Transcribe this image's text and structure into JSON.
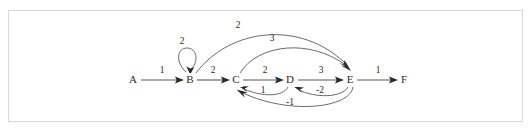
{
  "figure": {
    "type": "directed-weighted-graph",
    "border_color": "#d8d8d8",
    "background": "#ffffff",
    "line_color": "#595959",
    "text_color": "#2b2b2b"
  },
  "nodes": [
    {
      "id": "A",
      "label": "A",
      "x": 133,
      "y": 80
    },
    {
      "id": "B",
      "label": "B",
      "x": 190,
      "y": 80
    },
    {
      "id": "C",
      "label": "C",
      "x": 236,
      "y": 80
    },
    {
      "id": "D",
      "label": "D",
      "x": 290,
      "y": 80
    },
    {
      "id": "E",
      "label": "E",
      "x": 350,
      "y": 80
    },
    {
      "id": "F",
      "label": "F",
      "x": 404,
      "y": 80
    }
  ],
  "edges": [
    {
      "id": "a-b",
      "from": "A",
      "to": "B",
      "weight": "1",
      "shape": "straight",
      "label_x": 162,
      "label_y": 71
    },
    {
      "id": "b-b",
      "from": "B",
      "to": "B",
      "weight": "2",
      "shape": "self-loop",
      "label_x": 182,
      "label_y": 42
    },
    {
      "id": "b-c",
      "from": "B",
      "to": "C",
      "weight": "2",
      "shape": "straight",
      "label_x": 213,
      "label_y": 71
    },
    {
      "id": "c-d",
      "from": "C",
      "to": "D",
      "weight": "2",
      "shape": "straight",
      "label_x": 265,
      "label_y": 71
    },
    {
      "id": "d-e",
      "from": "D",
      "to": "E",
      "weight": "3",
      "shape": "straight",
      "label_x": 321,
      "label_y": 71
    },
    {
      "id": "e-f",
      "from": "E",
      "to": "F",
      "weight": "1",
      "shape": "straight",
      "label_x": 378,
      "label_y": 71
    },
    {
      "id": "b-e",
      "from": "B",
      "to": "E",
      "weight": "2",
      "shape": "arc-above",
      "label_x": 238,
      "label_y": 26
    },
    {
      "id": "c-e",
      "from": "C",
      "to": "E",
      "weight": "3",
      "shape": "arc-above",
      "label_x": 272,
      "label_y": 39
    },
    {
      "id": "d-c",
      "from": "D",
      "to": "C",
      "weight": "1",
      "shape": "arc-below",
      "label_x": 263,
      "label_y": 91
    },
    {
      "id": "e-d",
      "from": "E",
      "to": "D",
      "weight": "-2",
      "shape": "arc-below",
      "label_x": 320,
      "label_y": 91
    },
    {
      "id": "e-c",
      "from": "E",
      "to": "C",
      "weight": "-1",
      "shape": "arc-below-wide",
      "label_x": 290,
      "label_y": 103
    }
  ]
}
